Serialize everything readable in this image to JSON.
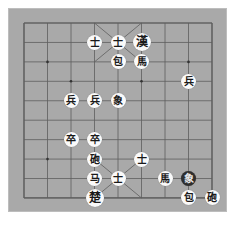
{
  "board": {
    "columns": 9,
    "rows": 10,
    "grid_origin": [
      24,
      23
    ],
    "col_step": 23.5,
    "row_step": 19.44,
    "colors": {
      "background": "#a9a9a9",
      "line": "#5e5e5e",
      "piece": "#fafafa",
      "piece_selected": "#2e2e2e"
    },
    "markers": [
      [
        1,
        2
      ],
      [
        2,
        3
      ],
      [
        7,
        2
      ],
      [
        5,
        3
      ],
      [
        1,
        7
      ]
    ]
  },
  "pieces": [
    {
      "label": "士",
      "col": 3,
      "row": 1,
      "name": "advisor",
      "style": "normal"
    },
    {
      "label": "士",
      "col": 4,
      "row": 1,
      "name": "advisor",
      "style": "normal"
    },
    {
      "label": "漢",
      "col": 5,
      "row": 1,
      "name": "general",
      "style": "big"
    },
    {
      "label": "包",
      "col": 4,
      "row": 2,
      "name": "cannon",
      "style": "normal"
    },
    {
      "label": "馬",
      "col": 5,
      "row": 2,
      "name": "horse",
      "style": "normal"
    },
    {
      "label": "兵",
      "col": 7,
      "row": 3,
      "name": "soldier",
      "style": "normal"
    },
    {
      "label": "兵",
      "col": 2,
      "row": 4,
      "name": "soldier",
      "style": "normal"
    },
    {
      "label": "兵",
      "col": 3,
      "row": 4,
      "name": "soldier",
      "style": "normal"
    },
    {
      "label": "象",
      "col": 4,
      "row": 4,
      "name": "elephant",
      "style": "normal"
    },
    {
      "label": "卒",
      "col": 2,
      "row": 6,
      "name": "soldier",
      "style": "normal"
    },
    {
      "label": "卒",
      "col": 3,
      "row": 6,
      "name": "soldier",
      "style": "normal"
    },
    {
      "label": "砲",
      "col": 3,
      "row": 7,
      "name": "cannon",
      "style": "normal"
    },
    {
      "label": "士",
      "col": 5,
      "row": 7,
      "name": "advisor",
      "style": "normal"
    },
    {
      "label": "马",
      "col": 3,
      "row": 8,
      "name": "horse",
      "style": "normal"
    },
    {
      "label": "士",
      "col": 4,
      "row": 8,
      "name": "advisor",
      "style": "normal"
    },
    {
      "label": "馬",
      "col": 6,
      "row": 8,
      "name": "horse",
      "style": "normal"
    },
    {
      "label": "象",
      "col": 7,
      "row": 8,
      "name": "elephant",
      "style": "dark"
    },
    {
      "label": "楚",
      "col": 3,
      "row": 9,
      "name": "general",
      "style": "big"
    },
    {
      "label": "包",
      "col": 7,
      "row": 9,
      "name": "cannon",
      "style": "normal"
    },
    {
      "label": "砲",
      "col": 8,
      "row": 9,
      "name": "cannon",
      "style": "normal"
    }
  ]
}
